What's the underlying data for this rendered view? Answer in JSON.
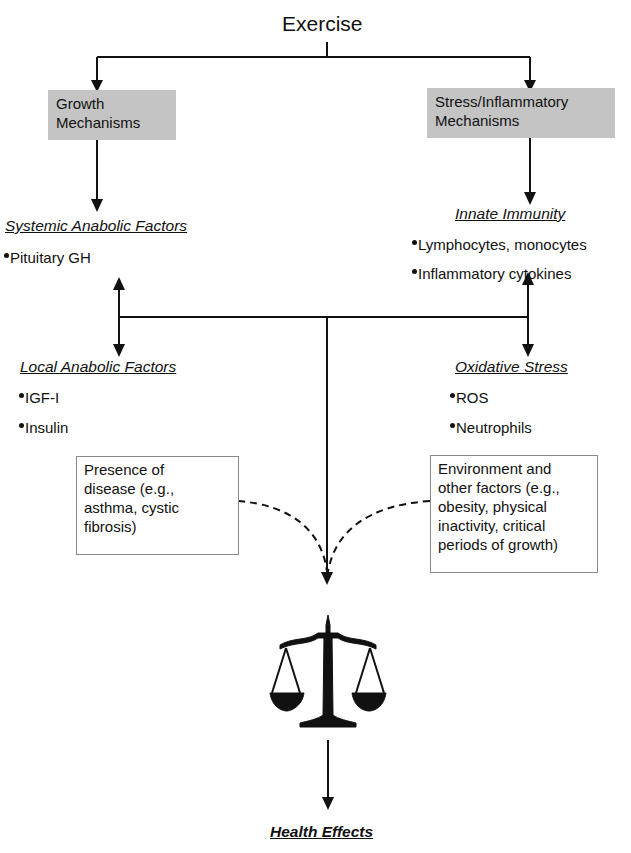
{
  "root": {
    "label": "Exercise"
  },
  "branches": {
    "growth": {
      "box_lines": [
        "Growth",
        "Mechanisms"
      ],
      "systemic": {
        "header": "Systemic Anabolic Factors",
        "items": [
          "Pituitary GH"
        ]
      },
      "local": {
        "header": "Local Anabolic Factors",
        "items": [
          "IGF-I",
          "Insulin"
        ]
      }
    },
    "stress": {
      "box_lines": [
        "Stress/Inflammatory",
        "Mechanisms"
      ],
      "innate": {
        "header": "Innate Immunity",
        "items": [
          "Lymphocytes, monocytes",
          "Inflammatory cytokines"
        ]
      },
      "oxidative": {
        "header": "Oxidative Stress",
        "items": [
          "ROS",
          "Neutrophils"
        ]
      }
    }
  },
  "modifiers": {
    "disease": {
      "lines": [
        "Presence of",
        "disease (e.g.,",
        "asthma, cystic",
        "fibrosis)"
      ]
    },
    "environment": {
      "lines": [
        "Environment and",
        "other factors (e.g.,",
        "obesity, physical",
        "inactivity, critical",
        "periods of growth)"
      ]
    }
  },
  "balance": {
    "icon": "balance-scale-icon"
  },
  "outcome": {
    "label": "Health Effects"
  },
  "colors": {
    "line": "#111111",
    "mechanism_box": "#c4c4c4",
    "modifier_border": "#8a8a8a"
  }
}
